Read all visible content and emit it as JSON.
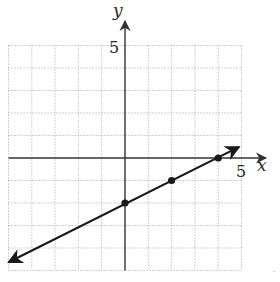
{
  "chart_data": {
    "type": "line",
    "title": "",
    "xlabel": "x",
    "ylabel": "y",
    "xlim": [
      -5,
      5
    ],
    "ylim": [
      -5,
      5
    ],
    "grid": true,
    "grid_step": 1,
    "x_tick_labels": [
      {
        "value": 5,
        "label": "5"
      }
    ],
    "y_tick_labels": [
      {
        "value": 5,
        "label": "5"
      }
    ],
    "series": [
      {
        "name": "line",
        "equation": "y = 0.5x - 2",
        "slope": 0.5,
        "intercept": -2,
        "x_range": [
          -5,
          4.9
        ],
        "arrows_both_ends": true,
        "points": [
          {
            "x": 0,
            "y": -2
          },
          {
            "x": 2,
            "y": -1
          },
          {
            "x": 4,
            "y": 0
          }
        ]
      }
    ]
  },
  "labels": {
    "x_axis": "x",
    "y_axis": "y",
    "x_tick": "5",
    "y_tick": "5"
  },
  "colors": {
    "background": "#ffffff",
    "grid": "#a8a8a8",
    "axis": "#333333",
    "line": "#1a1a1a",
    "point": "#1a1a1a"
  }
}
